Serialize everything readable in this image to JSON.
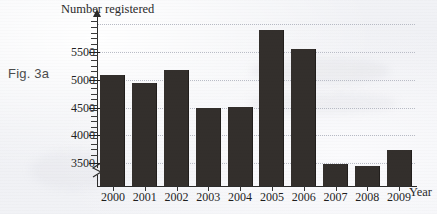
{
  "figure": {
    "label": "Fig. 3a"
  },
  "chart_data": {
    "type": "bar",
    "title": "",
    "ylabel": "Number registered",
    "xlabel": "Year",
    "categories": [
      "2000",
      "2001",
      "2002",
      "2003",
      "2004",
      "2005",
      "2006",
      "2007",
      "2008",
      "2009"
    ],
    "values": [
      5090,
      4940,
      5180,
      4500,
      4510,
      5890,
      5560,
      3490,
      3440,
      3740
    ],
    "ytick_labels": [
      "3500",
      "4000",
      "4500",
      "5000",
      "5500"
    ],
    "ytick_values": [
      3500,
      4000,
      4500,
      5000,
      5500
    ],
    "ylim": [
      3150,
      6080
    ],
    "y_axis_break": true,
    "grid": "horizontal-dotted",
    "legend": "none",
    "bar_color": "#332f2c",
    "gridline_color": "#b9bcc6",
    "axis_color": "#2b2b2b",
    "background_color": "#f2f3f7"
  }
}
